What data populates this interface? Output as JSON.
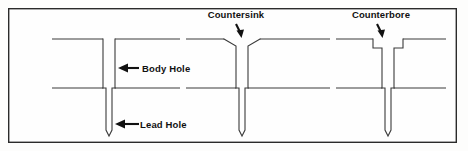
{
  "figure": {
    "background_color": "#fdfdfc",
    "frame_color": "#2b2b2b",
    "line_color": "#3a3a3a",
    "label_color": "#111111"
  },
  "labels": {
    "countersink": "Countersink",
    "counterbore": "Counterbore",
    "body_hole": "Body Hole",
    "lead_hole": "Lead Hole"
  },
  "icons": {
    "countersink_arrow": "down-arrow-icon",
    "counterbore_arrow": "down-arrow-icon",
    "body_hole_arrow": "left-arrow-icon",
    "lead_hole_arrow": "left-arrow-icon"
  },
  "geometry": {
    "frame": {
      "x": 8,
      "y": 8,
      "width": 449,
      "height": 135
    },
    "surface_y": 39,
    "joint_y": 88,
    "lead_bottom_y": 136,
    "holes": [
      {
        "name": "plain-body-hole",
        "type": "plain",
        "body_left": 103,
        "body_right": 115,
        "lead_left": 106,
        "lead_right": 112
      },
      {
        "name": "countersink-hole",
        "type": "countersink",
        "body_left": 236,
        "body_right": 248,
        "lead_left": 239,
        "lead_right": 245,
        "chamfer_half_width": 12,
        "chamfer_depth": 7
      },
      {
        "name": "counterbore-hole",
        "type": "counterbore",
        "body_left": 382,
        "body_right": 394,
        "lead_left": 385,
        "lead_right": 391,
        "bore_half_width": 9,
        "bore_depth": 9
      }
    ]
  },
  "annotations": [
    {
      "name": "countersink-callout",
      "label": "Countersink",
      "text_x": 235,
      "text_y": 18,
      "arrow_from_x": 235,
      "arrow_from_y": 23,
      "arrow_to_x": 241,
      "arrow_to_y": 38
    },
    {
      "name": "counterbore-callout",
      "label": "Counterbore",
      "text_x": 380,
      "text_y": 18,
      "arrow_from_x": 380,
      "arrow_from_y": 23,
      "arrow_to_x": 385,
      "arrow_to_y": 38
    },
    {
      "name": "body-hole-callout",
      "label": "Body Hole",
      "text_x": 143,
      "text_y": 71,
      "arrow_from_x": 140,
      "arrow_from_y": 68,
      "arrow_to_x": 118,
      "arrow_to_y": 68
    },
    {
      "name": "lead-hole-callout",
      "label": "Lead Hole",
      "text_x": 140,
      "text_y": 127,
      "arrow_from_x": 137,
      "arrow_from_y": 124,
      "arrow_to_x": 115,
      "arrow_to_y": 124
    }
  ]
}
